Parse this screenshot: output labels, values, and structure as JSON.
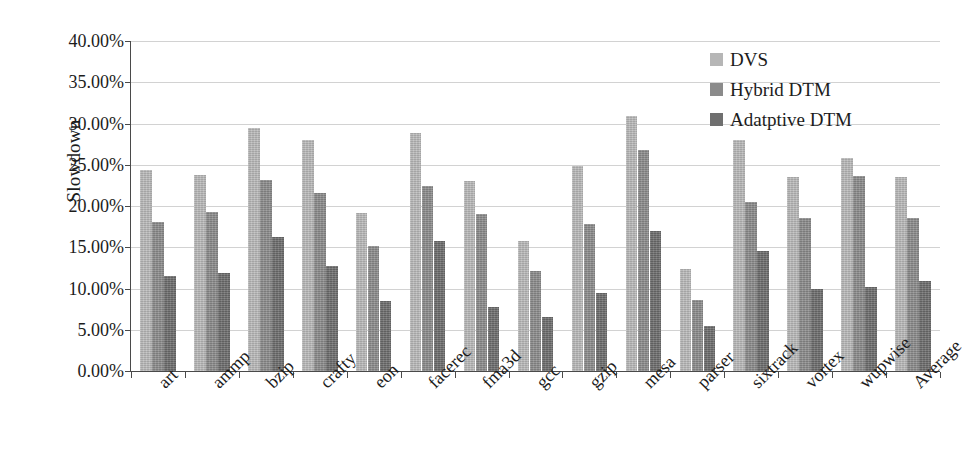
{
  "chart_data": {
    "type": "bar",
    "title": "",
    "xlabel": "",
    "ylabel": "Slowdown",
    "ylim": [
      0,
      40
    ],
    "ytick_step": 5,
    "ytick_labels": [
      "40.00%",
      "35.00%",
      "30.00%",
      "25.00%",
      "20.00%",
      "15.00%",
      "10.00%",
      "5.00%",
      "0.00%"
    ],
    "ytick_values": [
      40,
      35,
      30,
      25,
      20,
      15,
      10,
      5,
      0
    ],
    "grid": true,
    "legend_position": "top-right",
    "unit": "percent",
    "categories": [
      "art",
      "ammp",
      "bzip",
      "crafty",
      "eon",
      "facerec",
      "fma3d",
      "gcc",
      "gzip",
      "mesa",
      "parser",
      "sixtrack",
      "vortex",
      "wupwise",
      "Average"
    ],
    "series": [
      {
        "name": "DVS",
        "color": "#b6b6b6",
        "values": [
          24.4,
          23.8,
          29.4,
          28.0,
          19.2,
          28.9,
          23.0,
          15.8,
          24.8,
          30.9,
          12.4,
          28.0,
          23.5,
          25.8,
          23.5
        ]
      },
      {
        "name": "Hybrid DTM",
        "color": "#8b8b8b",
        "values": [
          18.1,
          19.3,
          23.2,
          21.6,
          15.2,
          22.4,
          19.0,
          12.1,
          17.8,
          26.8,
          8.6,
          20.5,
          18.6,
          23.6,
          18.6
        ]
      },
      {
        "name": "Adatptive DTM",
        "color": "#6f6f6f",
        "values": [
          11.5,
          11.9,
          16.3,
          12.7,
          8.5,
          15.7,
          7.7,
          6.5,
          9.5,
          17.0,
          5.4,
          14.6,
          9.9,
          10.2,
          10.9
        ]
      }
    ]
  }
}
